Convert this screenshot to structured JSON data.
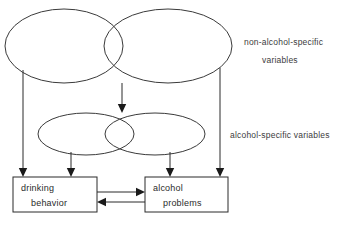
{
  "diagram": {
    "type": "conceptual-model",
    "background_color": "#ffffff",
    "line_color": "#2b2b2b",
    "text_color": "#3c3c3c",
    "groups": [
      {
        "id": "non-alcohol-specific",
        "label_line1": "non-alcohol-specific",
        "label_line2": "variables",
        "shape": "two-overlapping-ellipses"
      },
      {
        "id": "alcohol-specific",
        "label_line1": "alcohol-specific  variables",
        "shape": "two-overlapping-ellipses"
      }
    ],
    "boxes": [
      {
        "id": "drinking-behavior",
        "line1": "drinking",
        "line2": "behavior"
      },
      {
        "id": "alcohol-problems",
        "line1": "alcohol",
        "line2": "problems"
      }
    ],
    "arrows": [
      {
        "id": "big-left-to-drinking",
        "from": "non-alcohol-specific",
        "to": "drinking-behavior",
        "direction": "down"
      },
      {
        "id": "big-overlap-to-small-ellipses",
        "from": "non-alcohol-specific",
        "to": "alcohol-specific",
        "direction": "down"
      },
      {
        "id": "big-right-to-problems",
        "from": "non-alcohol-specific",
        "to": "alcohol-problems",
        "direction": "down"
      },
      {
        "id": "small-left-to-drinking",
        "from": "alcohol-specific",
        "to": "drinking-behavior",
        "direction": "down"
      },
      {
        "id": "small-right-to-problems",
        "from": "alcohol-specific",
        "to": "alcohol-problems",
        "direction": "down"
      },
      {
        "id": "drinking-to-problems",
        "from": "drinking-behavior",
        "to": "alcohol-problems",
        "direction": "right"
      },
      {
        "id": "problems-to-drinking",
        "from": "alcohol-problems",
        "to": "drinking-behavior",
        "direction": "left"
      }
    ]
  }
}
